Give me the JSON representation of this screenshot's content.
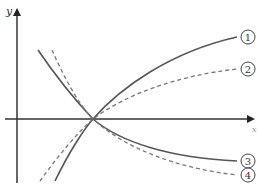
{
  "diagram": {
    "type": "function-graph",
    "axes": {
      "x_label": "x",
      "y_label": "y",
      "origin_px": [
        17,
        119
      ],
      "color": "#333333"
    },
    "intersection_point_px": [
      93,
      119
    ],
    "curves": [
      {
        "id": "1",
        "label": "1",
        "style": "solid",
        "direction": "increasing",
        "color": "#555555",
        "path": "M 55 181 C 70 150, 85 128, 93 119 C 120 88, 170 52, 237 37",
        "label_pos": [
          248,
          37
        ]
      },
      {
        "id": "2",
        "label": "2",
        "style": "dashed",
        "direction": "increasing",
        "color": "#777777",
        "path": "M 40 181 C 55 160, 75 135, 93 119 C 125 95, 175 76, 237 69",
        "label_pos": [
          248,
          69
        ]
      },
      {
        "id": "3",
        "label": "3",
        "style": "solid",
        "direction": "decreasing",
        "color": "#555555",
        "path": "M 38 50 C 55 75, 75 100, 93 119 C 120 142, 170 158, 237 161",
        "label_pos": [
          248,
          161
        ]
      },
      {
        "id": "4",
        "label": "4",
        "style": "dashed",
        "direction": "decreasing",
        "color": "#777777",
        "path": "M 52 50 C 63 75, 78 104, 93 119 C 125 148, 175 168, 237 175",
        "label_pos": [
          248,
          175
        ]
      }
    ]
  }
}
